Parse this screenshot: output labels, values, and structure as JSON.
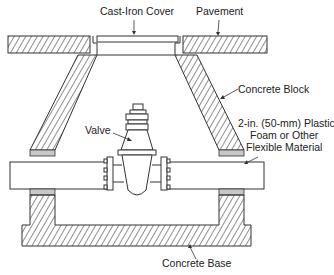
{
  "diagram": {
    "labels": {
      "cover": "Cast-Iron Cover",
      "pavement": "Pavement",
      "block": "Concrete Block",
      "flex_line1": "2-in. (50-mm) Plastic",
      "flex_line2": "Foam or Other",
      "flex_line3": "Flexible Material",
      "valve": "Valve",
      "base": "Concrete Base"
    },
    "colors": {
      "line": "#333333",
      "hatch": "#333333",
      "foam": "#c8c8c8",
      "background": "#ffffff"
    }
  }
}
